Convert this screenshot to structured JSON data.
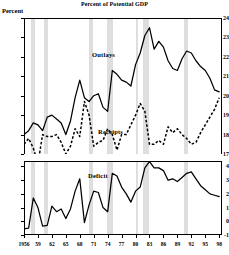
{
  "title": "Percent of Potential GDP",
  "axis_unit": "Percent",
  "labels": {
    "outlays": "Outlays",
    "receipts": "Receipts",
    "deficit": "Deficit"
  },
  "chart_data": {
    "type": "line",
    "title": "Percent of Potential GDP",
    "xlabel": "",
    "ylabel": "Percent",
    "grid": false,
    "legend": "inline-annotations",
    "panels": [
      {
        "name": "top",
        "ylim": [
          17,
          24
        ],
        "yticks": [
          17,
          18,
          19,
          20,
          21,
          22,
          23,
          24
        ],
        "series": [
          {
            "name": "Outlays",
            "style": "solid",
            "x": [
              1956,
              1957,
              1958,
              1959,
              1960,
              1961,
              1962,
              1963,
              1964,
              1965,
              1966,
              1967,
              1968,
              1969,
              1970,
              1971,
              1972,
              1973,
              1974,
              1975,
              1976,
              1977,
              1978,
              1979,
              1980,
              1981,
              1982,
              1983,
              1984,
              1985,
              1986,
              1987,
              1988,
              1989,
              1990,
              1991,
              1992,
              1993,
              1994,
              1995,
              1996,
              1997,
              1998
            ],
            "values": [
              18.0,
              18.2,
              18.6,
              18.5,
              18.2,
              18.9,
              19.0,
              18.8,
              18.6,
              18.0,
              18.7,
              19.9,
              20.8,
              19.9,
              19.7,
              20.0,
              20.1,
              19.4,
              19.2,
              21.3,
              21.1,
              20.8,
              20.7,
              20.5,
              21.6,
              22.2,
              23.1,
              23.5,
              22.4,
              22.8,
              22.5,
              21.8,
              21.4,
              21.3,
              21.9,
              22.3,
              22.2,
              21.8,
              21.5,
              21.3,
              20.9,
              20.3,
              20.2
            ]
          },
          {
            "name": "Receipts",
            "style": "dashed",
            "x": [
              1956,
              1957,
              1958,
              1959,
              1960,
              1961,
              1962,
              1963,
              1964,
              1965,
              1966,
              1967,
              1968,
              1969,
              1970,
              1971,
              1972,
              1973,
              1974,
              1975,
              1976,
              1977,
              1978,
              1979,
              1980,
              1981,
              1982,
              1983,
              1984,
              1985,
              1986,
              1987,
              1988,
              1989,
              1990,
              1991,
              1992,
              1993,
              1994,
              1995,
              1996,
              1997,
              1998
            ],
            "values": [
              17.5,
              17.8,
              17.3,
              16.5,
              18.0,
              17.9,
              17.9,
              18.0,
              17.6,
              17.0,
              17.4,
              18.3,
              17.9,
              19.7,
              19.0,
              17.4,
              17.6,
              17.7,
              18.3,
              18.0,
              17.2,
              18.0,
              18.0,
              18.5,
              19.0,
              19.6,
              19.2,
              17.5,
              17.5,
              17.7,
              17.5,
              18.4,
              18.1,
              18.3,
              18.0,
              17.8,
              17.5,
              17.6,
              18.1,
              18.5,
              18.9,
              19.3,
              19.9
            ]
          }
        ]
      },
      {
        "name": "bottom",
        "ylim": [
          -1,
          4.4
        ],
        "yticks": [
          -1,
          0,
          1,
          2,
          3,
          4
        ],
        "series": [
          {
            "name": "Deficit",
            "style": "solid",
            "x": [
              1956,
              1957,
              1958,
              1959,
              1960,
              1961,
              1962,
              1963,
              1964,
              1965,
              1966,
              1967,
              1968,
              1969,
              1970,
              1971,
              1972,
              1973,
              1974,
              1975,
              1976,
              1977,
              1978,
              1979,
              1980,
              1981,
              1982,
              1983,
              1984,
              1985,
              1986,
              1987,
              1988,
              1989,
              1990,
              1991,
              1992,
              1993,
              1994,
              1995,
              1996,
              1997,
              1998
            ],
            "values": [
              -0.55,
              -0.5,
              1.7,
              1.0,
              -0.35,
              -0.3,
              1.1,
              0.7,
              0.9,
              0.2,
              0.9,
              2.2,
              3.1,
              -0.1,
              1.2,
              2.2,
              2.1,
              1.0,
              0.7,
              3.5,
              3.3,
              2.5,
              2.0,
              1.4,
              2.2,
              2.5,
              3.9,
              4.35,
              3.9,
              3.9,
              3.7,
              3.0,
              3.1,
              2.9,
              3.2,
              3.5,
              3.6,
              3.1,
              2.6,
              2.3,
              2.0,
              1.9,
              1.8
            ]
          }
        ]
      }
    ],
    "recession_bands": [
      {
        "start": 1957.6,
        "end": 1958.4
      },
      {
        "start": 1960.3,
        "end": 1961.2
      },
      {
        "start": 1969.9,
        "end": 1970.9
      },
      {
        "start": 1973.9,
        "end": 1975.2
      },
      {
        "start": 1980.0,
        "end": 1980.6
      },
      {
        "start": 1981.5,
        "end": 1982.9
      },
      {
        "start": 1990.5,
        "end": 1991.2
      }
    ],
    "xticks": [
      {
        "x": 1956,
        "label": "1956"
      },
      {
        "x": 1959,
        "label": "59"
      },
      {
        "x": 1962,
        "label": "62"
      },
      {
        "x": 1965,
        "label": "65"
      },
      {
        "x": 1968,
        "label": "68"
      },
      {
        "x": 1971,
        "label": "71"
      },
      {
        "x": 1974,
        "label": "74"
      },
      {
        "x": 1977,
        "label": "77"
      },
      {
        "x": 1980,
        "label": "80"
      },
      {
        "x": 1983,
        "label": "83"
      },
      {
        "x": 1986,
        "label": "86"
      },
      {
        "x": 1989,
        "label": "89"
      },
      {
        "x": 1992,
        "label": "92"
      },
      {
        "x": 1995,
        "label": "95"
      },
      {
        "x": 1998,
        "label": "98"
      }
    ],
    "xlim": [
      1956,
      1998.6
    ]
  }
}
